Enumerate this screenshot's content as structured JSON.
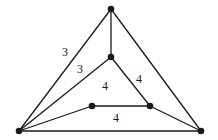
{
  "diagram": {
    "type": "planar-graph",
    "nodes": [
      {
        "id": "top",
        "x": 111,
        "y": 9
      },
      {
        "id": "mid",
        "x": 111,
        "y": 57
      },
      {
        "id": "inner-left",
        "x": 92,
        "y": 106
      },
      {
        "id": "inner-right",
        "x": 150,
        "y": 106
      },
      {
        "id": "bottom-left",
        "x": 19,
        "y": 131
      },
      {
        "id": "bottom-right",
        "x": 201,
        "y": 131
      }
    ],
    "edges": [
      {
        "from": "top",
        "to": "bottom-left"
      },
      {
        "from": "top",
        "to": "bottom-right"
      },
      {
        "from": "top",
        "to": "mid"
      },
      {
        "from": "mid",
        "to": "bottom-left"
      },
      {
        "from": "mid",
        "to": "inner-right"
      },
      {
        "from": "inner-left",
        "to": "inner-right"
      },
      {
        "from": "inner-left",
        "to": "bottom-left"
      },
      {
        "from": "inner-right",
        "to": "bottom-right"
      },
      {
        "from": "bottom-left",
        "to": "bottom-right"
      }
    ],
    "face_labels": [
      {
        "text": "3",
        "x": 65,
        "y": 56
      },
      {
        "text": "3",
        "x": 80,
        "y": 73
      },
      {
        "text": "4",
        "x": 105,
        "y": 90
      },
      {
        "text": "4",
        "x": 139,
        "y": 83
      },
      {
        "text": "4",
        "x": 116,
        "y": 122
      }
    ]
  }
}
